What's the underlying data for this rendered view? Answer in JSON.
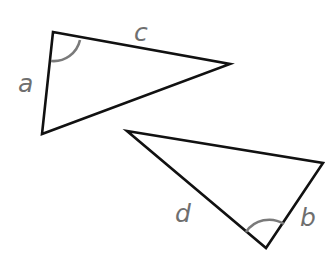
{
  "diagram": {
    "type": "two-triangles",
    "colors": {
      "edge": "#111111",
      "angle_arc": "#7a7a7a",
      "label": "#6f6f6f",
      "background": "#ffffff"
    },
    "triangles": [
      {
        "id": "triangle-1",
        "vertices": [
          [
            53,
            32
          ],
          [
            230,
            64
          ],
          [
            42,
            134
          ]
        ],
        "marked_angle_vertex": [
          53,
          32
        ],
        "labels": [
          {
            "text": "a",
            "side": "left",
            "x": 18,
            "y": 92
          },
          {
            "text": "c",
            "side": "top",
            "x": 134,
            "y": 41
          }
        ]
      },
      {
        "id": "triangle-2",
        "vertices": [
          [
            127,
            131
          ],
          [
            323,
            163
          ],
          [
            266,
            248
          ]
        ],
        "marked_angle_vertex": [
          266,
          248
        ],
        "labels": [
          {
            "text": "d",
            "side": "lower-left",
            "x": 175,
            "y": 222
          },
          {
            "text": "b",
            "side": "lower-right",
            "x": 300,
            "y": 226
          }
        ]
      }
    ]
  }
}
